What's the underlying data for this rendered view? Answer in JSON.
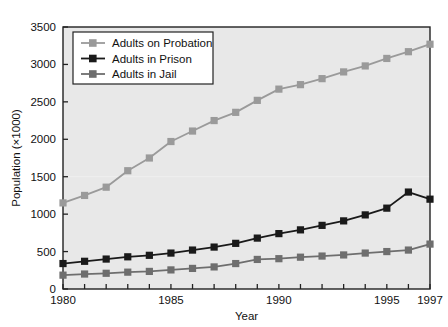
{
  "chart_data": {
    "type": "line",
    "title": "",
    "xlabel": "Year",
    "ylabel": "Population (×1000)",
    "xlim": [
      1980,
      1997
    ],
    "ylim": [
      0,
      3500
    ],
    "xticks": [
      1980,
      1985,
      1990,
      1995,
      1997
    ],
    "xtick_labels": [
      "1980",
      "1985",
      "1990",
      "1995",
      "1997"
    ],
    "yticks": [
      0,
      500,
      1000,
      1500,
      2000,
      2500,
      3000,
      3500
    ],
    "ytick_labels": [
      "0",
      "500",
      "1000",
      "1500",
      "2000",
      "2500",
      "3000",
      "3500"
    ],
    "grid": false,
    "legend_position": "upper left",
    "x": [
      1980,
      1981,
      1982,
      1983,
      1984,
      1985,
      1986,
      1987,
      1988,
      1989,
      1990,
      1991,
      1992,
      1993,
      1994,
      1995,
      1996,
      1997
    ],
    "series": [
      {
        "name": "Adults on Probation",
        "color": "#9a9a9a",
        "marker": "square",
        "values": [
          1150,
          1250,
          1360,
          1580,
          1750,
          1970,
          2110,
          2250,
          2360,
          2520,
          2670,
          2730,
          2810,
          2900,
          2980,
          3080,
          3170,
          3270
        ]
      },
      {
        "name": "Adults in Prison",
        "color": "#1a1a1a",
        "marker": "square",
        "values": [
          340,
          370,
          400,
          430,
          450,
          480,
          520,
          560,
          610,
          680,
          740,
          790,
          850,
          910,
          990,
          1080,
          1295,
          1200
        ]
      },
      {
        "name": "Adults in Jail",
        "color": "#6e6e6e",
        "marker": "square",
        "values": [
          185,
          200,
          210,
          225,
          235,
          255,
          275,
          295,
          340,
          395,
          405,
          425,
          440,
          455,
          480,
          500,
          520,
          600
        ]
      }
    ]
  },
  "legend": {
    "entries": [
      {
        "label": "Adults on Probation"
      },
      {
        "label": "Adults in Prison"
      },
      {
        "label": "Adults in Jail"
      }
    ]
  },
  "colors": {
    "probation": "#9a9a9a",
    "prison": "#1a1a1a",
    "jail": "#6e6e6e",
    "plot_background": "#e8e8e8",
    "figure_background": "#ffffff",
    "axis": "#222222"
  }
}
